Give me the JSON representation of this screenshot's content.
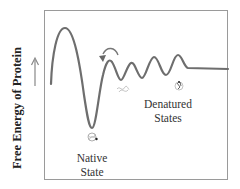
{
  "diagram": {
    "y_axis_label": "Free Energy of Protein",
    "labels": {
      "native_line1": "Native",
      "native_line2": "State",
      "denatured_line1": "Denatured",
      "denatured_line2": "States"
    },
    "colors": {
      "curve": "#6e6e6e",
      "frame": "#9a9a9a",
      "text": "#333333",
      "arrow": "#888888"
    },
    "icons": [
      "up-arrow-icon",
      "curved-arrow-icon",
      "protein-molecule-icon"
    ]
  }
}
